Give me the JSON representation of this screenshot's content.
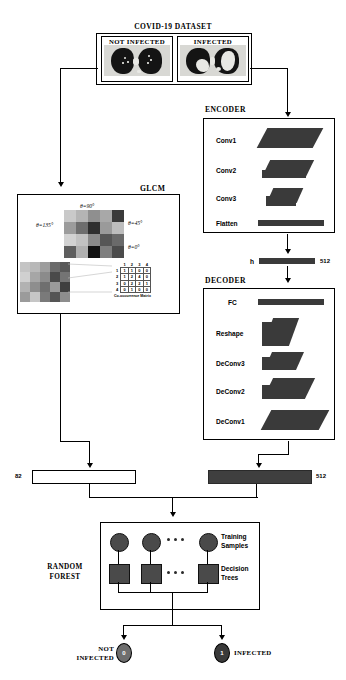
{
  "diagram": {
    "title": "COVID-19 DATASET",
    "dataset": {
      "label_not_infected": "NOT INFECTED",
      "label_infected": "INFECTED"
    },
    "encoder": {
      "title": "ENCODER",
      "layers": [
        "Conv1",
        "Conv2",
        "Conv3",
        "Flatten"
      ]
    },
    "latent": {
      "symbol": "h",
      "size": "512"
    },
    "decoder": {
      "title": "DECODER",
      "layers": [
        "FC",
        "Reshape",
        "DeConv3",
        "DeConv2",
        "DeConv1"
      ]
    },
    "glcm": {
      "title": "GLCM",
      "angles": [
        "θ=90°",
        "θ=135°",
        "θ=45°",
        "θ=0°"
      ],
      "matrix_caption": "Co-occurrence Matrix",
      "matrix_headers": [
        "1",
        "2",
        "3",
        "4"
      ],
      "matrix_rows": [
        {
          "label": "1",
          "values": [
            "1",
            "1",
            "0",
            "0"
          ]
        },
        {
          "label": "2",
          "values": [
            "1",
            "2",
            "4",
            "0"
          ]
        },
        {
          "label": "3",
          "values": [
            "0",
            "2",
            "2",
            "1"
          ]
        },
        {
          "label": "4",
          "values": [
            "0",
            "1",
            "0",
            "0"
          ]
        }
      ]
    },
    "features": {
      "glcm_vector_size": "82",
      "latent_vector_size": "512"
    },
    "random_forest": {
      "title_line1": "RANDOM",
      "title_line2": "FOREST",
      "training_samples_line1": "Training",
      "training_samples_line2": "Samples",
      "decision_trees_line1": "Decision",
      "decision_trees_line2": "Trees",
      "ellipsis": "• • •"
    },
    "output": {
      "not_infected_line1": "NOT",
      "not_infected_line2": "INFECTED",
      "not_infected_value": "0",
      "infected_label": "INFECTED",
      "infected_value": "1"
    },
    "colors": {
      "slab": "#3a3a3a",
      "stroke": "#000000",
      "node": "#4a4a4a",
      "bar_dark": "#3f3f3f"
    }
  }
}
